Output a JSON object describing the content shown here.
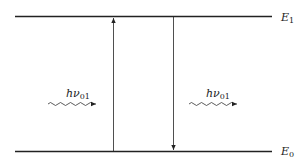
{
  "diagram": {
    "type": "energy-level-diagram",
    "levels": [
      {
        "name": "E",
        "subscript": "1",
        "position": "upper"
      },
      {
        "name": "E",
        "subscript": "0",
        "position": "lower"
      }
    ],
    "transitions": [
      {
        "direction": "up",
        "from": "E0",
        "to": "E1",
        "kind": "absorption"
      },
      {
        "direction": "down",
        "from": "E1",
        "to": "E0",
        "kind": "emission"
      }
    ],
    "photons": [
      {
        "label_main": "hν",
        "label_sub": "01",
        "side": "left",
        "relation": "absorbed"
      },
      {
        "label_main": "hν",
        "label_sub": "01",
        "side": "right",
        "relation": "emitted"
      }
    ]
  }
}
